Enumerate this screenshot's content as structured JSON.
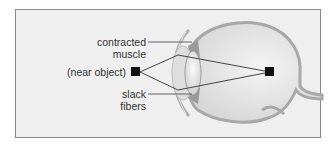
{
  "diagram": {
    "labels": {
      "contracted_muscle_line1": "contracted",
      "contracted_muscle_line2": "muscle",
      "near_object": "(near object)",
      "slack_fibers_line1": "slack",
      "slack_fibers_line2": "fibers"
    },
    "colors": {
      "background": "#efefef",
      "border": "#8a8a8a",
      "eye_fill": "#e2e2e2",
      "sclera": "#b8b8b8",
      "object": "#111111"
    }
  }
}
